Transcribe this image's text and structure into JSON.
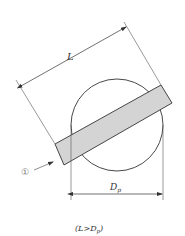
{
  "diagram": {
    "labels": {
      "length": "L",
      "diameter_main": "D",
      "diameter_sub": "p",
      "marker": "①",
      "condition": "(L>Dp)",
      "condition_open": "(L>D",
      "condition_sub": "p",
      "condition_close": ")"
    },
    "colors": {
      "stroke": "#333333",
      "rect_fill": "#d4d4d4",
      "dim_line": "#555555",
      "marker": "#888888"
    }
  }
}
